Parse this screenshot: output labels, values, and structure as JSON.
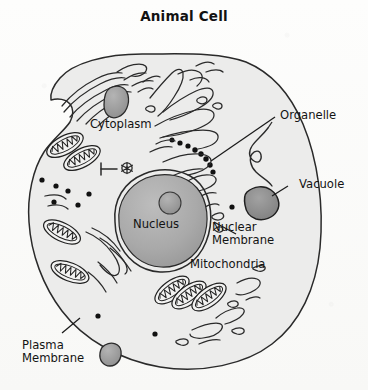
{
  "diagram": {
    "title": "Animal Cell",
    "type": "biology-labeled-diagram",
    "background_color": "#fbfbfa",
    "ink_color": "#1a1a1a"
  },
  "labels": {
    "cytoplasm": "Cytoplasm",
    "organelle": "Organelle",
    "vacuole": "Vacuole",
    "nucleus": "Nucleus",
    "nuclear_membrane": "Nuclear\nMembrane",
    "mitochondria": "Mitochondria",
    "plasma_membrane": "Plasma\nMembrane"
  },
  "structures": {
    "cell_body": {
      "name": "plasma membrane outline",
      "fill": "#ececeb",
      "stroke": "#2a2a2a"
    },
    "nucleus": {
      "name": "nucleus",
      "fill": "#a8a8a8",
      "stroke": "#2a2a2a"
    },
    "nucleolus": {
      "name": "nucleolus",
      "fill": "#9a9a9a"
    },
    "nuclear_membrane": {
      "name": "nuclear membrane",
      "stroke": "#2a2a2a"
    },
    "vacuole": {
      "name": "vacuole",
      "fill": "#8f8f8f",
      "stroke": "#1f1f1f"
    },
    "organelle_blobs": {
      "name": "dark organelle",
      "fill": "#9c9c9c"
    },
    "mitochondria_count": 7,
    "ribosome_dots": {
      "name": "ribosomes",
      "fill": "#111111"
    },
    "endoplasmic_reticulum": {
      "name": "endoplasmic reticulum strands",
      "stroke": "#2a2a2a"
    },
    "golgi": {
      "name": "golgi apparatus strands",
      "stroke": "#2a2a2a"
    },
    "centriole": {
      "name": "centriole pair",
      "stroke": "#2a2a2a"
    }
  }
}
